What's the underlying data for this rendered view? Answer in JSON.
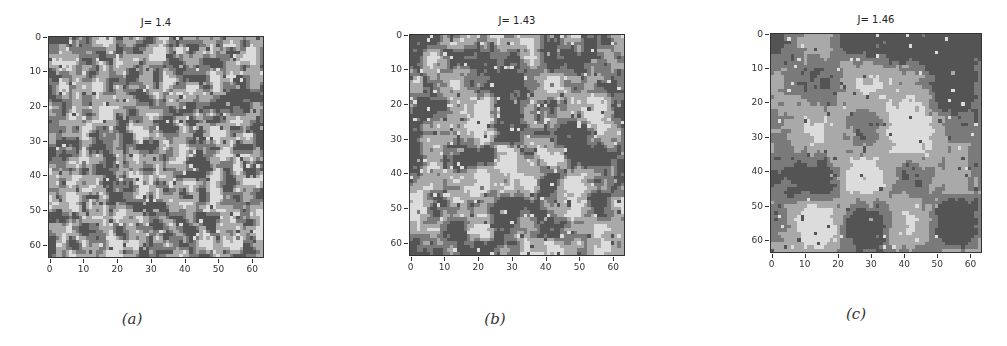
{
  "chart_data": [
    {
      "type": "heatmap",
      "title": "J= 1.4",
      "caption": "(a)",
      "grid_size": [
        64,
        64
      ],
      "xlim": [
        0,
        63
      ],
      "ylim": [
        63,
        0
      ],
      "xticks": [
        0,
        10,
        20,
        30,
        40,
        50,
        60
      ],
      "yticks": [
        0,
        10,
        20,
        30,
        40,
        50,
        60
      ],
      "levels": 4,
      "colormap": [
        "#545454",
        "#7a7a7a",
        "#a9a9a9",
        "#dcdcdc"
      ],
      "description": "Disordered lattice configuration, small mixed domains of four gray states",
      "seed": 11,
      "cluster_scale": 3.5,
      "grid": "off"
    },
    {
      "type": "heatmap",
      "title": "J= 1.43",
      "caption": "(b)",
      "grid_size": [
        64,
        64
      ],
      "xlim": [
        0,
        63
      ],
      "ylim": [
        63,
        0
      ],
      "xticks": [
        0,
        10,
        20,
        30,
        40,
        50,
        60
      ],
      "yticks": [
        0,
        10,
        20,
        30,
        40,
        50,
        60
      ],
      "levels": 4,
      "colormap": [
        "#545454",
        "#7a7a7a",
        "#a9a9a9",
        "#dcdcdc"
      ],
      "description": "Intermediate configuration with medium-sized domains; large light domain near (25,45), light domain near (45,28)",
      "seed": 23,
      "cluster_scale": 7,
      "grid": "off"
    },
    {
      "type": "heatmap",
      "title": "J= 1.46",
      "caption": "(c)",
      "grid_size": [
        64,
        64
      ],
      "xlim": [
        0,
        63
      ],
      "ylim": [
        63,
        0
      ],
      "xticks": [
        0,
        10,
        20,
        30,
        40,
        50,
        60
      ],
      "yticks": [
        0,
        10,
        20,
        30,
        40,
        50,
        60
      ],
      "levels": 4,
      "colormap": [
        "#545454",
        "#7a7a7a",
        "#a9a9a9",
        "#dcdcdc"
      ],
      "description": "Ordered configuration with large domains: dark domain on left, light domains upper-right and lower-right",
      "seed": 37,
      "cluster_scale": 14,
      "grid": "off"
    }
  ],
  "panels": [
    {
      "title": "J= 1.4",
      "caption": "(a)"
    },
    {
      "title": "J= 1.43",
      "caption": "(b)"
    },
    {
      "title": "J= 1.46",
      "caption": "(c)"
    }
  ]
}
